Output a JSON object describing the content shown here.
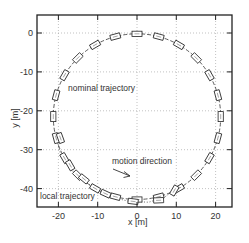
{
  "chart_data": {
    "type": "line",
    "title": "",
    "xlabel": "x [m]",
    "ylabel": "y [m]",
    "xlim": [
      -25.5,
      24
    ],
    "ylim": [
      -44.5,
      4.5
    ],
    "x_ticks": [
      -20,
      -10,
      0,
      10,
      20
    ],
    "y_ticks": [
      0,
      -10,
      -20,
      -30,
      -40
    ],
    "x_tick_labels": [
      "-20",
      "-10",
      "0",
      "10",
      "20"
    ],
    "y_tick_labels": [
      "0",
      "-10",
      "-20",
      "-30",
      "-40"
    ],
    "grid": true,
    "legend": null,
    "annotations": [
      {
        "text": "nominal trajectory",
        "x": -12,
        "y": -14
      },
      {
        "text": "motion direction",
        "x": -2,
        "y": -33,
        "arrow_to": [
          -0.5,
          -37
        ]
      },
      {
        "text": "local trajectory",
        "x": -22,
        "y": -41
      }
    ],
    "series": [
      {
        "name": "nominal trajectory",
        "style": "dashed",
        "shape": "circle",
        "center": [
          0,
          -21.5
        ],
        "radius": 21.3,
        "vehicle_markers_deg": [
          90,
          105,
          120,
          135,
          150,
          165,
          180,
          195,
          210,
          225,
          240,
          255,
          270,
          285,
          300,
          315,
          330,
          345,
          0,
          15,
          30,
          45,
          60,
          75
        ]
      },
      {
        "name": "local trajectory",
        "style": "dotted",
        "x": [
          -20.5,
          -19.5,
          -17,
          -13.5,
          -10,
          -6,
          -2,
          3,
          7,
          10
        ],
        "y": [
          -27,
          -31,
          -35,
          -38,
          -40.5,
          -42.3,
          -43.3,
          -43.5,
          -42.2,
          -40
        ],
        "vehicle_markers": [
          [
            -19.5,
            -27
          ],
          [
            -17,
            -34
          ],
          [
            -13.5,
            -37.5
          ],
          [
            -8,
            -41.3
          ],
          [
            -1,
            -43.3
          ],
          [
            5.5,
            -43
          ]
        ]
      }
    ]
  },
  "labels": {
    "xlabel": "x [m]",
    "ylabel": "y [m]",
    "nominal": "nominal trajectory",
    "motion": "motion direction",
    "local": "local trajectory"
  }
}
